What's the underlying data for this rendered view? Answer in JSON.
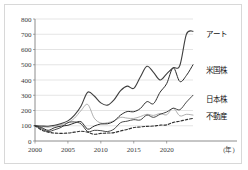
{
  "chart_data": {
    "type": "line",
    "title": "",
    "xlabel": "(年)",
    "ylabel": "",
    "xlim": [
      2000,
      2024
    ],
    "ylim": [
      0,
      800
    ],
    "yticks": [
      0,
      100,
      200,
      300,
      400,
      500,
      600,
      700,
      800
    ],
    "xticks": [
      2000,
      2005,
      2010,
      2015,
      2020
    ],
    "grid": true,
    "legend_position": "inline-right-of-line-end",
    "note": "Index values rebased to 100 at year 2000",
    "series": [
      {
        "name": "アート",
        "label": "アート",
        "color": "#3f3f3f",
        "style": "solid",
        "width": 1.1,
        "x": [
          2000,
          2001,
          2002,
          2003,
          2004,
          2005,
          2006,
          2007,
          2008,
          2009,
          2010,
          2011,
          2012,
          2013,
          2014,
          2015,
          2016,
          2017,
          2018,
          2019,
          2020,
          2021,
          2022,
          2023,
          2024
        ],
        "values": [
          100,
          98,
          97,
          103,
          115,
          132,
          170,
          230,
          320,
          295,
          250,
          235,
          270,
          330,
          360,
          345,
          420,
          490,
          450,
          400,
          440,
          480,
          495,
          700,
          720
        ]
      },
      {
        "name": "米国株",
        "label": "米国株",
        "color": "#2b2b2b",
        "style": "solid",
        "width": 1.0,
        "x": [
          2000,
          2001,
          2002,
          2003,
          2004,
          2005,
          2006,
          2007,
          2008,
          2009,
          2010,
          2011,
          2012,
          2013,
          2014,
          2015,
          2016,
          2017,
          2018,
          2019,
          2020,
          2021,
          2022,
          2023,
          2024
        ],
        "values": [
          100,
          88,
          70,
          88,
          98,
          103,
          118,
          126,
          78,
          98,
          112,
          113,
          130,
          170,
          193,
          192,
          213,
          258,
          245,
          320,
          376,
          480,
          390,
          430,
          500
        ]
      },
      {
        "name": "日本株",
        "label": "日本株",
        "color": "#333333",
        "style": "solid",
        "width": 0.9,
        "x": [
          2000,
          2001,
          2002,
          2003,
          2004,
          2005,
          2006,
          2007,
          2008,
          2009,
          2010,
          2011,
          2012,
          2013,
          2014,
          2015,
          2016,
          2017,
          2018,
          2019,
          2020,
          2021,
          2022,
          2023,
          2024
        ],
        "values": [
          100,
          80,
          62,
          74,
          90,
          120,
          125,
          112,
          62,
          70,
          68,
          62,
          78,
          120,
          130,
          140,
          138,
          170,
          155,
          175,
          190,
          215,
          205,
          255,
          300
        ]
      },
      {
        "name": "不動産",
        "label": "不動産",
        "color": "#2e2e2e",
        "style": "dashed",
        "width": 1.1,
        "x": [
          2000,
          2001,
          2002,
          2003,
          2004,
          2005,
          2006,
          2007,
          2008,
          2009,
          2010,
          2011,
          2012,
          2013,
          2014,
          2015,
          2016,
          2017,
          2018,
          2019,
          2020,
          2021,
          2022,
          2023,
          2024
        ],
        "values": [
          100,
          72,
          58,
          52,
          50,
          52,
          58,
          64,
          58,
          44,
          50,
          52,
          55,
          66,
          76,
          88,
          92,
          96,
          98,
          104,
          106,
          122,
          130,
          140,
          148
        ]
      },
      {
        "name": "グレー系列",
        "label": "",
        "color": "#9a9a9a",
        "style": "solid",
        "width": 0.8,
        "x": [
          2000,
          2001,
          2002,
          2003,
          2004,
          2005,
          2006,
          2007,
          2008,
          2009,
          2010,
          2011,
          2012,
          2013,
          2014,
          2015,
          2016,
          2017,
          2018,
          2019,
          2020,
          2021,
          2022,
          2023,
          2024
        ],
        "values": [
          100,
          95,
          90,
          98,
          108,
          120,
          150,
          200,
          240,
          150,
          118,
          120,
          132,
          155,
          150,
          148,
          160,
          175,
          168,
          180,
          172,
          215,
          165,
          175,
          170
        ]
      }
    ],
    "series_labels": [
      {
        "text": "アート",
        "x_px": 205,
        "y_px": 36
      },
      {
        "text": "米国株",
        "x_px": 205,
        "y_px": 72
      },
      {
        "text": "日本株",
        "x_px": 205,
        "y_px": 101
      },
      {
        "text": "不動産",
        "x_px": 205,
        "y_px": 118
      }
    ]
  }
}
